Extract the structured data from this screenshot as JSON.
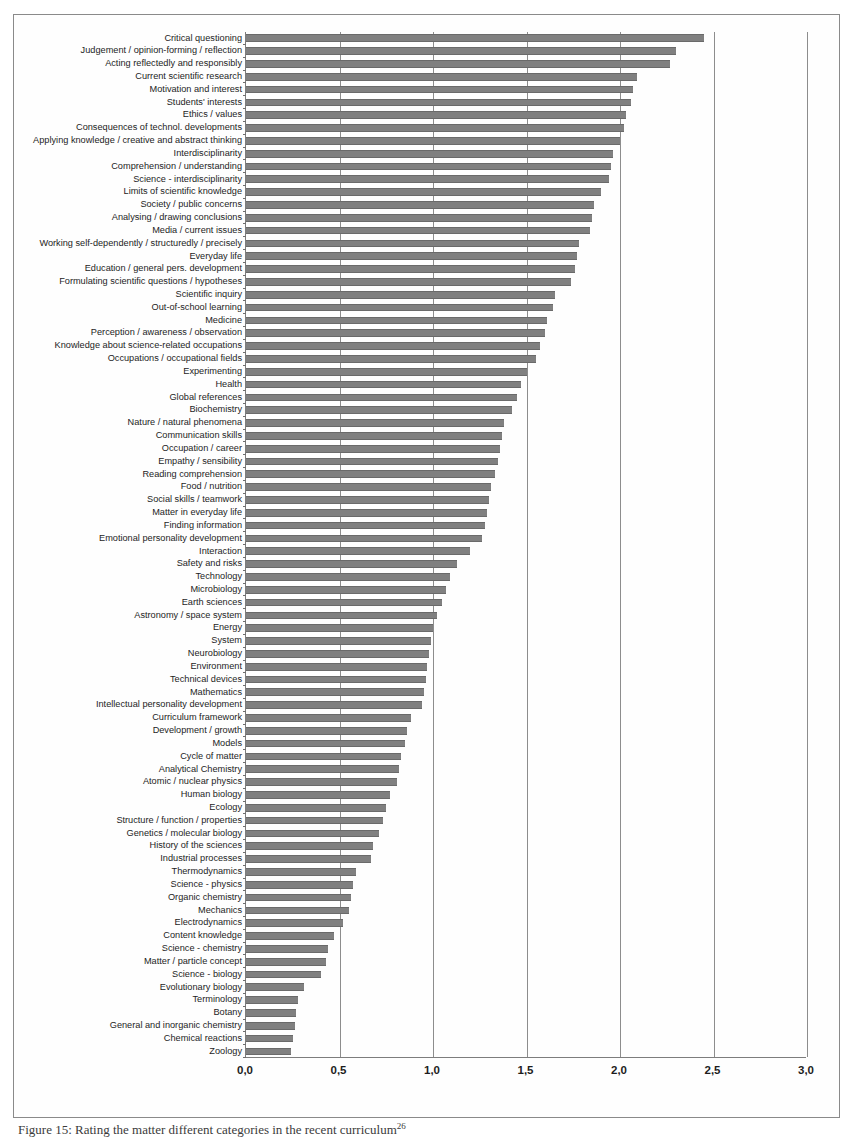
{
  "figure": {
    "caption": "Figure 15: Rating the matter different categories in the recent curriculum",
    "caption_superscript": "26"
  },
  "chart_data": {
    "type": "bar",
    "orientation": "horizontal",
    "title": "",
    "xlabel": "",
    "ylabel": "",
    "xlim": [
      0.0,
      3.0
    ],
    "xticks": [
      "0,0",
      "0,5",
      "1,0",
      "1,5",
      "2,0",
      "2,5",
      "3,0"
    ],
    "xtick_values": [
      0.0,
      0.5,
      1.0,
      1.5,
      2.0,
      2.5,
      3.0
    ],
    "grid": "vertical",
    "legend": "none",
    "bar_color": "#808080",
    "decimal_separator": ",",
    "categories": [
      "Critical questioning",
      "Judgement / opinion-forming / reflection",
      "Acting reflectedly and responsibly",
      "Current scientific research",
      "Motivation and interest",
      "Students' interests",
      "Ethics / values",
      "Consequences of technol. developments",
      "Applying knowledge / creative and abstract thinking",
      "Interdisciplinarity",
      "Comprehension / understanding",
      "Science - interdisciplinarity",
      "Limits of scientific knowledge",
      "Society / public concerns",
      "Analysing / drawing conclusions",
      "Media / current issues",
      "Working self-dependently / structuredly / precisely",
      "Everyday life",
      "Education / general pers. development",
      "Formulating scientific questions / hypotheses",
      "Scientific inquiry",
      "Out-of-school learning",
      "Medicine",
      "Perception / awareness / observation",
      "Knowledge about science-related occupations",
      "Occupations / occupational fields",
      "Experimenting",
      "Health",
      "Global references",
      "Biochemistry",
      "Nature / natural phenomena",
      "Communication skills",
      "Occupation / career",
      "Empathy / sensibility",
      "Reading comprehension",
      "Food / nutrition",
      "Social skills / teamwork",
      "Matter in everyday life",
      "Finding information",
      "Emotional personality development",
      "Interaction",
      "Safety and risks",
      "Technology",
      "Microbiology",
      "Earth sciences",
      "Astronomy / space system",
      "Energy",
      "System",
      "Neurobiology",
      "Environment",
      "Technical devices",
      "Mathematics",
      "Intellectual personality development",
      "Curriculum framework",
      "Development / growth",
      "Models",
      "Cycle of matter",
      "Analytical Chemistry",
      "Atomic / nuclear physics",
      "Human biology",
      "Ecology",
      "Structure / function / properties",
      "Genetics / molecular biology",
      "History of the sciences",
      "Industrial processes",
      "Thermodynamics",
      "Science - physics",
      "Organic chemistry",
      "Mechanics",
      "Electrodynamics",
      "Content knowledge",
      "Science - chemistry",
      "Matter / particle concept",
      "Science - biology",
      "Evolutionary biology",
      "Terminology",
      "Botany",
      "General and inorganic chemistry",
      "Chemical reactions",
      "Zoology"
    ],
    "values": [
      2.45,
      2.3,
      2.27,
      2.09,
      2.07,
      2.06,
      2.03,
      2.02,
      2.0,
      1.96,
      1.95,
      1.94,
      1.9,
      1.86,
      1.85,
      1.84,
      1.78,
      1.77,
      1.76,
      1.74,
      1.65,
      1.64,
      1.61,
      1.6,
      1.57,
      1.55,
      1.5,
      1.47,
      1.45,
      1.42,
      1.38,
      1.37,
      1.36,
      1.35,
      1.33,
      1.31,
      1.3,
      1.29,
      1.28,
      1.26,
      1.2,
      1.13,
      1.09,
      1.07,
      1.05,
      1.02,
      1.0,
      0.99,
      0.98,
      0.97,
      0.96,
      0.95,
      0.94,
      0.88,
      0.86,
      0.85,
      0.83,
      0.82,
      0.81,
      0.77,
      0.75,
      0.73,
      0.71,
      0.68,
      0.67,
      0.59,
      0.57,
      0.56,
      0.55,
      0.52,
      0.47,
      0.44,
      0.43,
      0.4,
      0.31,
      0.28,
      0.27,
      0.26,
      0.25,
      0.24
    ]
  }
}
